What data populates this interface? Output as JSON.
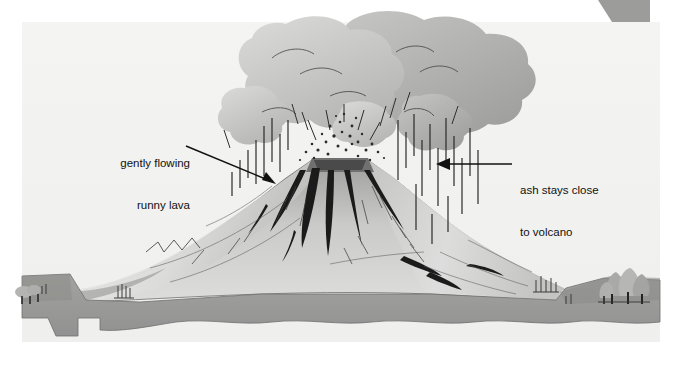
{
  "figure": {
    "kind": "volcano-eruption-cross-section",
    "width": 673,
    "height": 372,
    "background_color": "#ffffff"
  },
  "labels": {
    "lava": {
      "line1": "gently flowing",
      "line2": "runny lava",
      "arrow": "points down-right to the left flank of the volcano cone"
    },
    "ash": {
      "line1": "ash stays close",
      "line2": "to volcano",
      "arrow": "points left toward the falling ash beside the cone"
    }
  },
  "scene": {
    "sky_color": "#f2f2f0",
    "ground_color": "#9a9a9a",
    "cone_light_color": "#d7d7d5",
    "cone_shadow_color": "#8e8e8e",
    "cloud_light_color": "#cfcfcd",
    "cloud_dark_color": "#a2a2a0",
    "lava_color": "#1c1c1c",
    "line_color": "#2a2a2a",
    "elements": [
      "ash cloud billowing above the crater",
      "volcanic cone with broad gentle slopes",
      "crater with erupting ejecta speckles",
      "dark runny lava flows down the cone",
      "falling ash streaks beside the cone",
      "ground layer across the base",
      "tree cluster on the right ridge"
    ]
  }
}
